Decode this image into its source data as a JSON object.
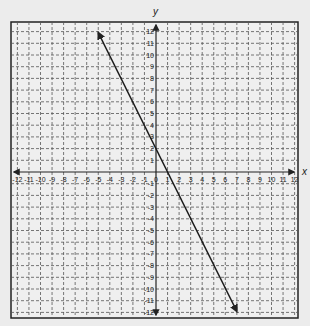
{
  "chart_data": {
    "type": "line",
    "title": "",
    "xlabel": "x",
    "ylabel": "y",
    "xlim": [
      -12,
      12
    ],
    "ylim": [
      -12,
      12
    ],
    "grid": true,
    "grid_style": "dashed",
    "x_ticks": [
      -12,
      -11,
      -10,
      -9,
      -8,
      -7,
      -6,
      -5,
      -4,
      -3,
      -2,
      -1,
      0,
      1,
      2,
      3,
      4,
      5,
      6,
      7,
      8,
      9,
      10,
      11,
      12
    ],
    "y_ticks": [
      -12,
      -11,
      -10,
      -9,
      -8,
      -7,
      -6,
      -5,
      -4,
      -3,
      -2,
      -1,
      1,
      2,
      3,
      4,
      5,
      6,
      7,
      8,
      9,
      10,
      11,
      12
    ],
    "series": [
      {
        "name": "line",
        "equation": "y = -2x + 2",
        "slope": -2,
        "intercept": 2,
        "points": [
          [
            -5,
            12
          ],
          [
            1,
            0
          ],
          [
            0,
            2
          ],
          [
            7,
            -12
          ]
        ],
        "arrows_both_ends": true
      }
    ]
  },
  "colors": {
    "background": "#ececec",
    "grid": "#555555",
    "axis": "#222222",
    "line": "#1a1a1a"
  }
}
